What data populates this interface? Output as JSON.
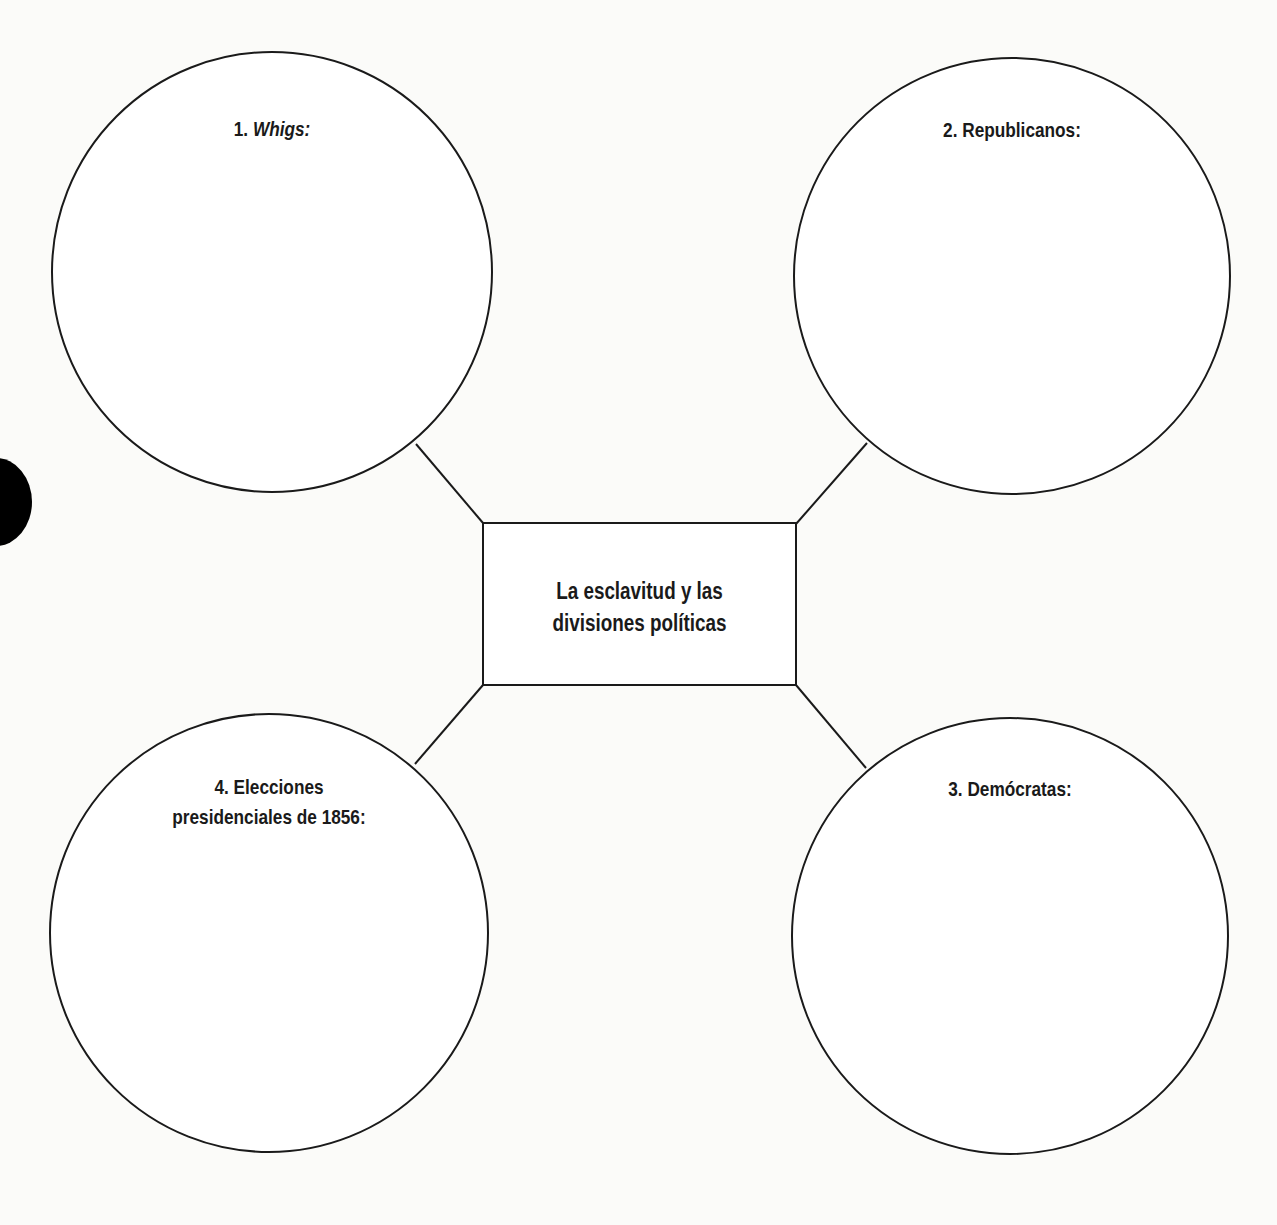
{
  "diagram": {
    "type": "concept-map",
    "center": {
      "line1": "La esclavitud y las",
      "line2": "divisiones políticas"
    },
    "nodes": [
      {
        "number": "1.",
        "title": "Whigs:",
        "italic": true,
        "position": "top-left"
      },
      {
        "number": "2.",
        "title": "Republicanos:",
        "italic": false,
        "position": "top-right"
      },
      {
        "number": "3.",
        "title": "Demócratas:",
        "italic": false,
        "position": "bottom-right"
      },
      {
        "number": "4.",
        "title": "Elecciones",
        "title_line2": "presidenciales de 1856:",
        "italic": false,
        "position": "bottom-left"
      }
    ],
    "colors": {
      "stroke": "#1a1a1a",
      "background": "#fbfbf9",
      "text": "#1a1a1a"
    }
  }
}
